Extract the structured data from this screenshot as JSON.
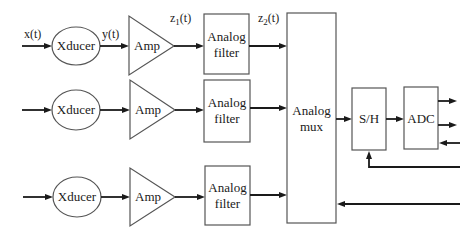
{
  "diagram": {
    "type": "block-diagram",
    "channels": [
      {
        "transducer_label": "Xducer",
        "amp_label": "Amp",
        "filter_label_line1": "Analog",
        "filter_label_line2": "filter",
        "input_signal": "x(t)",
        "transducer_output_signal": "y(t)",
        "amp_output_signal": "z",
        "amp_output_subscript": "1",
        "amp_output_suffix": "(t)",
        "filter_output_signal": "z",
        "filter_output_subscript": "2",
        "filter_output_suffix": "(t)"
      },
      {
        "transducer_label": "Xducer",
        "amp_label": "Amp",
        "filter_label_line1": "Analog",
        "filter_label_line2": "filter"
      },
      {
        "transducer_label": "Xducer",
        "amp_label": "Amp",
        "filter_label_line1": "Analog",
        "filter_label_line2": "filter"
      }
    ],
    "mux": {
      "label_line1": "Analog",
      "label_line2": "mux"
    },
    "sample_hold": {
      "label": "S/H"
    },
    "adc": {
      "label": "ADC"
    },
    "edges": [
      "x(t) -> Xducer",
      "Xducer -> Amp",
      "Amp -> Analog filter",
      "Analog filter -> Analog mux",
      "Analog mux -> S/H",
      "S/H -> ADC",
      "ADC -> output (2)",
      "input -> ADC",
      "control -> S/H",
      "control -> Analog mux"
    ]
  }
}
